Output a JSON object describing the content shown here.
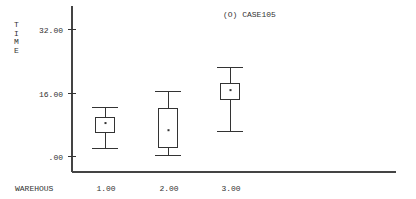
{
  "chart_data": {
    "type": "boxplot",
    "title": "(O) CASE105",
    "xlabel": "WAREHOUS",
    "ylabel": "TIME",
    "ylim": [
      0,
      32
    ],
    "yticks": [
      {
        "value": 0,
        "label": ".00"
      },
      {
        "value": 16,
        "label": "16.00"
      },
      {
        "value": 32,
        "label": "32.00"
      }
    ],
    "categories": [
      "1.00",
      "2.00",
      "3.00"
    ],
    "boxes": [
      {
        "category": "1.00",
        "whisker_low": 2.0,
        "q1": 6.0,
        "mean": 8.3,
        "q3": 9.8,
        "whisker_high": 12.3
      },
      {
        "category": "2.00",
        "whisker_low": 0.3,
        "q1": 2.3,
        "mean": 6.5,
        "q3": 12.1,
        "whisker_high": 16.4
      },
      {
        "category": "3.00",
        "whisker_low": 6.3,
        "q1": 14.4,
        "mean": 16.6,
        "q3": 18.4,
        "whisker_high": 22.4
      }
    ],
    "grid": false,
    "legend": null
  }
}
